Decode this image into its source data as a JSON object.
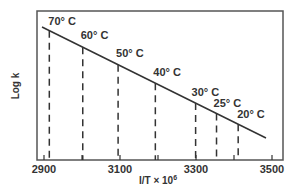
{
  "chart_data": {
    "type": "line",
    "title": "",
    "xlabel": "I/T × 10⁶",
    "xlabel_base": "I/T × 10",
    "xlabel_sup": "6",
    "ylabel": "Log k",
    "xlim": [
      2880,
      3540
    ],
    "x_ticks": [
      2900,
      3000,
      3100,
      3200,
      3300,
      3400,
      3500
    ],
    "x_tick_labels": [
      "2900",
      "3100",
      "3300",
      "3500"
    ],
    "y_ticks": [],
    "grid": false,
    "legend": null,
    "series": [
      {
        "name": "Log k vs 1/T",
        "style": "solid straight line, decreasing",
        "x_start": 2900,
        "x_end": 3480
      }
    ],
    "points": [
      {
        "label": "70° C",
        "x": 2914
      },
      {
        "label": "60° C",
        "x": 3002
      },
      {
        "label": "50° C",
        "x": 3095
      },
      {
        "label": "40° C",
        "x": 3193
      },
      {
        "label": "30° C",
        "x": 3299
      },
      {
        "label": "25° C",
        "x": 3354
      },
      {
        "label": "20° C",
        "x": 3411
      }
    ],
    "annotations": "Dashed vertical drop lines from each temperature point on the line down to the x-axis"
  },
  "colors": {
    "ink": "#333333",
    "frame": "#555555",
    "background": "#ffffff"
  }
}
